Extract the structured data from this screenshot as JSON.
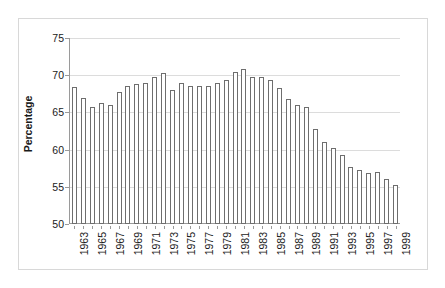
{
  "chart_data": {
    "type": "bar",
    "title": "",
    "subtitle": "",
    "xlabel": "",
    "ylabel": "Percentage",
    "ylim": [
      50,
      75
    ],
    "yticks": [
      50,
      55,
      60,
      65,
      70,
      75
    ],
    "ytick_labels": [
      "50",
      "55",
      "60",
      "65",
      "70",
      "75"
    ],
    "grid": true,
    "legend": false,
    "legend_position": "none",
    "categories": [
      "1963",
      "1964",
      "1965",
      "1966",
      "1967",
      "1968",
      "1969",
      "1970",
      "1971",
      "1972",
      "1973",
      "1974",
      "1975",
      "1976",
      "1977",
      "1978",
      "1979",
      "1980",
      "1981",
      "1982",
      "1983",
      "1984",
      "1985",
      "1986",
      "1987",
      "1988",
      "1989",
      "1990",
      "1991",
      "1992",
      "1993",
      "1994",
      "1995",
      "1996",
      "1997",
      "1998",
      "1999"
    ],
    "visible_tick_labels": [
      "1963",
      "1965",
      "1967",
      "1969",
      "1971",
      "1973",
      "1975",
      "1977",
      "1979",
      "1981",
      "1983",
      "1985",
      "1987",
      "1989",
      "1991",
      "1993",
      "1995",
      "1997",
      "1999"
    ],
    "values": [
      68.4,
      67.0,
      65.7,
      66.2,
      66.0,
      67.8,
      68.5,
      68.8,
      69.0,
      69.7,
      70.3,
      68.0,
      68.9,
      68.5,
      68.6,
      68.5,
      68.9,
      69.3,
      70.4,
      70.9,
      69.8,
      69.7,
      69.3,
      68.3,
      66.8,
      66.0,
      65.7,
      62.8,
      61.0,
      60.2,
      59.3,
      57.7,
      57.3,
      56.9,
      57.0,
      56.1,
      55.3
    ],
    "bar_style": {
      "fill": "#ffffff",
      "edge": "#6e6e6e"
    },
    "axis_color": "#9a9a9a",
    "grid_color": "#dcdcdc",
    "text_color": "#1a1a1a",
    "frame_color": "#d8d8d8"
  }
}
